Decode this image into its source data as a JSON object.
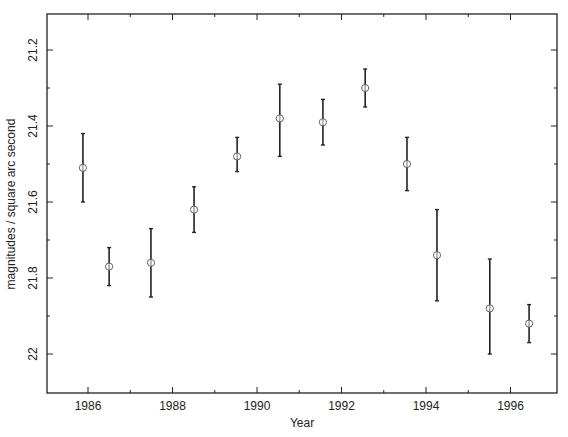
{
  "chart_data": {
    "type": "scatter",
    "subtype": "errorbar",
    "title": "",
    "xlabel": "Year",
    "ylabel": "magnitudes / square arc second",
    "xlim": [
      1985.0,
      1997.1
    ],
    "ylim": [
      22.1,
      21.1
    ],
    "y_inverted": true,
    "x_ticks": [
      1986,
      1988,
      1990,
      1992,
      1994,
      1996
    ],
    "x_tick_labels": [
      "1986",
      "1988",
      "1990",
      "1992",
      "1994",
      "1996"
    ],
    "x_minor_ticks": [
      1987,
      1989,
      1991,
      1993,
      1995
    ],
    "y_ticks": [
      21.2,
      21.4,
      21.6,
      21.8,
      22.0
    ],
    "y_tick_labels": [
      "21.2",
      "21.4",
      "21.6",
      "21.8",
      "22"
    ],
    "y_minor_ticks": [
      21.3,
      21.5,
      21.7,
      21.9
    ],
    "grid": false,
    "legend": null,
    "marker": "open-circle",
    "color": "#222222",
    "series": [
      {
        "name": "sky brightness",
        "x": [
          1985.88,
          1986.5,
          1987.49,
          1988.51,
          1989.53,
          1990.54,
          1991.56,
          1992.56,
          1993.55,
          1994.26,
          1995.51,
          1996.44
        ],
        "y": [
          21.51,
          21.77,
          21.76,
          21.62,
          21.48,
          21.38,
          21.39,
          21.3,
          21.5,
          21.74,
          21.88,
          21.92
        ],
        "y_low": [
          21.42,
          21.72,
          21.67,
          21.56,
          21.43,
          21.29,
          21.33,
          21.25,
          21.43,
          21.62,
          21.75,
          21.87
        ],
        "y_high": [
          21.6,
          21.82,
          21.85,
          21.68,
          21.52,
          21.48,
          21.45,
          21.35,
          21.57,
          21.86,
          22.0,
          21.97
        ]
      }
    ]
  }
}
